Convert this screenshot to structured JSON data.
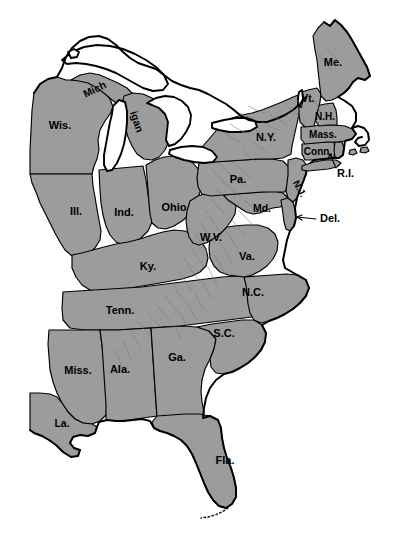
{
  "map": {
    "title": "Eastern United States",
    "projection_note": "state outline map with shaded states",
    "colors": {
      "state_fill": "#9c9c9c",
      "state_border": "#000000",
      "background": "#ffffff",
      "water_fill": "#ffffff",
      "relief_shading": "#7d7d7d"
    },
    "labels": [
      {
        "id": "wisconsin",
        "text": "Wis.",
        "x": 60,
        "y": 126,
        "size": 11,
        "rotate": 0
      },
      {
        "id": "michigan-up",
        "text": "Mich",
        "x": 95,
        "y": 90,
        "size": 10.5,
        "rotate": -26
      },
      {
        "id": "michigan-lp",
        "text": "igan",
        "x": 136,
        "y": 122,
        "size": 10.5,
        "rotate": 72
      },
      {
        "id": "illinois",
        "text": "Ill.",
        "x": 76,
        "y": 212,
        "size": 11,
        "rotate": 0
      },
      {
        "id": "indiana",
        "text": "Ind.",
        "x": 124,
        "y": 213,
        "size": 11,
        "rotate": 0
      },
      {
        "id": "ohio",
        "text": "Ohio",
        "x": 174,
        "y": 208,
        "size": 11,
        "rotate": 0
      },
      {
        "id": "kentucky",
        "text": "Ky.",
        "x": 148,
        "y": 267,
        "size": 11,
        "rotate": 0
      },
      {
        "id": "tennessee",
        "text": "Tenn.",
        "x": 120,
        "y": 311,
        "size": 11,
        "rotate": 0
      },
      {
        "id": "mississippi",
        "text": "Miss.",
        "x": 78,
        "y": 371,
        "size": 11,
        "rotate": 0
      },
      {
        "id": "alabama",
        "text": "Ala.",
        "x": 120,
        "y": 370,
        "size": 11,
        "rotate": 0
      },
      {
        "id": "georgia",
        "text": "Ga.",
        "x": 177,
        "y": 358,
        "size": 11,
        "rotate": 0
      },
      {
        "id": "louisiana",
        "text": "La.",
        "x": 62,
        "y": 424,
        "size": 10.5,
        "rotate": 0
      },
      {
        "id": "florida",
        "text": "Fla.",
        "x": 225,
        "y": 461,
        "size": 11,
        "rotate": 0
      },
      {
        "id": "south-carolina",
        "text": "S.C.",
        "x": 224,
        "y": 334,
        "size": 11,
        "rotate": 0
      },
      {
        "id": "north-carolina",
        "text": "N.C.",
        "x": 253,
        "y": 293,
        "size": 11,
        "rotate": 0
      },
      {
        "id": "virginia",
        "text": "Va.",
        "x": 247,
        "y": 257,
        "size": 11,
        "rotate": 0
      },
      {
        "id": "west-virginia",
        "text": "W.V.",
        "x": 211,
        "y": 238,
        "size": 11,
        "rotate": 0
      },
      {
        "id": "maryland",
        "text": "Md.",
        "x": 262,
        "y": 209,
        "size": 10.5,
        "rotate": 0
      },
      {
        "id": "pennsylvania",
        "text": "Pa.",
        "x": 238,
        "y": 180,
        "size": 11,
        "rotate": 0
      },
      {
        "id": "new-york",
        "text": "N.Y.",
        "x": 266,
        "y": 138,
        "size": 11,
        "rotate": 0
      },
      {
        "id": "new-jersey",
        "text": "N.J.",
        "x": 299,
        "y": 189,
        "size": 9.5,
        "rotate": 62
      },
      {
        "id": "connecticut",
        "text": "Conn.",
        "x": 318,
        "y": 152,
        "size": 10,
        "rotate": 0
      },
      {
        "id": "massachusetts",
        "text": "Mass.",
        "x": 323,
        "y": 135,
        "size": 10,
        "rotate": 0
      },
      {
        "id": "new-hampshire",
        "text": "N.H.",
        "x": 325,
        "y": 117,
        "size": 10,
        "rotate": 0
      },
      {
        "id": "vermont",
        "text": "Vt.",
        "x": 308,
        "y": 99,
        "size": 10,
        "rotate": 0
      },
      {
        "id": "maine",
        "text": "Me.",
        "x": 333,
        "y": 63,
        "size": 11,
        "rotate": 0
      }
    ],
    "callouts": [
      {
        "id": "rhode-island",
        "text": "R.I.",
        "label_x": 337,
        "label_y": 174,
        "size": 11,
        "leader": "M 336 168 L 329 152"
      },
      {
        "id": "delaware",
        "text": "Del.",
        "label_x": 320,
        "label_y": 219,
        "size": 11,
        "leader": "M 316 219 L 297 217"
      }
    ]
  }
}
